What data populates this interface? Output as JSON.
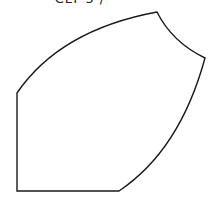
{
  "diagram": {
    "caption": "CLT 5 /",
    "shape": {
      "type": "curved-polygon",
      "stroke": "#1a1a1a",
      "fill": "#ffffff",
      "stroke_width": 1.4,
      "vertices": [
        {
          "name": "bottom-left",
          "x": 17,
          "y": 191
        },
        {
          "name": "bottom-right",
          "x": 119,
          "y": 191
        },
        {
          "name": "right",
          "x": 205,
          "y": 58
        },
        {
          "name": "top",
          "x": 157,
          "y": 12
        },
        {
          "name": "left-top",
          "x": 17,
          "y": 93
        }
      ],
      "path": "M17,191 L119,191 Q180,150 205,58 Q172,42 157,12 Q60,30 17,93 Z"
    }
  }
}
